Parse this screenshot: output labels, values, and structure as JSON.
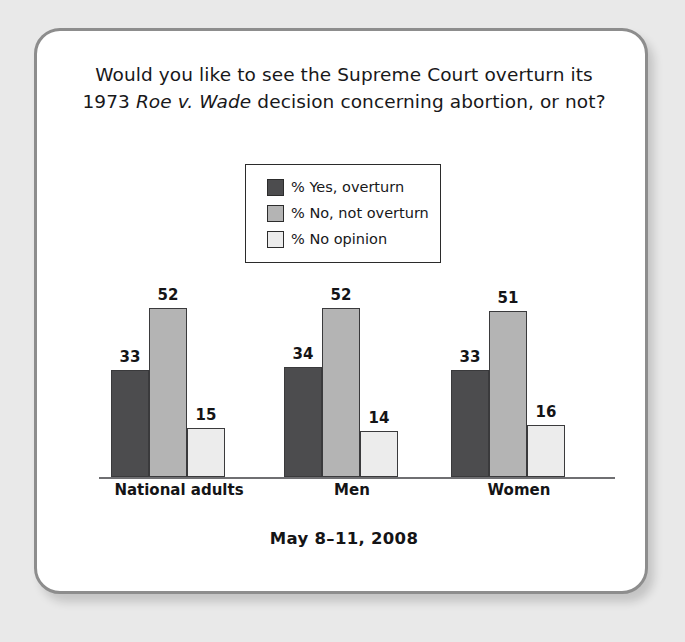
{
  "card": {
    "title_line1": "Would you like to see the Supreme Court overturn its",
    "title_line2_pre": "1973 ",
    "title_line2_italic": "Roe v. Wade",
    "title_line2_post": " decision concerning abortion, or not?",
    "footer": "May 8–11, 2008"
  },
  "colors": {
    "series_yes": "#4c4c4e",
    "series_no": "#b4b4b4",
    "series_no_opinion": "#ececec",
    "border": "#8d8d8d",
    "axis": "#6f6f72",
    "text": "#141416",
    "page_background": "#e9e9e9",
    "card_background": "#ffffff"
  },
  "chart_data": {
    "type": "bar",
    "title": "Would you like to see the Supreme Court overturn its 1973 Roe v. Wade decision concerning abortion, or not?",
    "subtitle": "May 8–11, 2008",
    "categories": [
      "National adults",
      "Men",
      "Women"
    ],
    "series": [
      {
        "name": "% Yes, overturn",
        "values": [
          33,
          52,
          33
        ],
        "color": "#4c4c4e"
      },
      {
        "name": "% No, not overturn",
        "values": [
          52,
          52,
          51
        ],
        "color": "#b4b4b4"
      },
      {
        "name": "% No opinion",
        "values": [
          15,
          14,
          16
        ],
        "color": "#ececec"
      }
    ],
    "groups": [
      {
        "category": "National adults",
        "values": [
          33,
          52,
          15
        ]
      },
      {
        "category": "Men",
        "values": [
          34,
          52,
          14
        ]
      },
      {
        "category": "Women",
        "values": [
          33,
          51,
          16
        ]
      }
    ],
    "xlabel": "",
    "ylabel": "",
    "ylim": [
      0,
      60
    ],
    "grid": false,
    "legend_position": "top-center",
    "data_labels": true
  },
  "legend": {
    "items": [
      {
        "label": "% Yes, overturn",
        "swatch": "#4c4c4e"
      },
      {
        "label": "% No, not overturn",
        "swatch": "#b4b4b4"
      },
      {
        "label": "% No opinion",
        "swatch": "#ececec"
      }
    ]
  }
}
